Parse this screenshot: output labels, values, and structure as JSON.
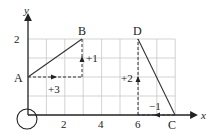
{
  "diagram": {
    "axes": {
      "x_label": "x",
      "y_label": "y"
    },
    "x_ticks": [
      {
        "value": 2,
        "label": "2"
      },
      {
        "value": 4,
        "label": "4"
      },
      {
        "value": 6,
        "label": "6"
      }
    ],
    "y_ticks": [
      {
        "value": 2,
        "label": "2"
      }
    ],
    "points": {
      "A": {
        "label": "A",
        "x": 0,
        "y": 1
      },
      "B": {
        "label": "B",
        "x": 3,
        "y": 2
      },
      "C": {
        "label": "C",
        "x": 8,
        "y": 0
      },
      "D": {
        "label": "D",
        "x": 6,
        "y": 2
      }
    },
    "steps": {
      "ab_run": "+3",
      "ab_rise": "+1",
      "cd_run": "−1",
      "cd_rise": "+2"
    },
    "origin_marker": "circle"
  }
}
